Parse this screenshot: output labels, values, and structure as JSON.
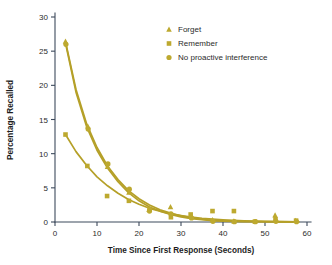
{
  "chart_data": {
    "type": "scatter",
    "title": "",
    "xlabel": "Time Since First Response (Seconds)",
    "ylabel": "Percentage Recalled",
    "xlim": [
      0,
      60
    ],
    "ylim": [
      0,
      30
    ],
    "xticks": [
      0,
      10,
      20,
      30,
      40,
      50,
      60
    ],
    "yticks": [
      0,
      5,
      10,
      15,
      20,
      25,
      30
    ],
    "xtick_labels": [
      "0",
      "10",
      "20",
      "30",
      "40",
      "50",
      "60"
    ],
    "ytick_labels": [
      "0",
      "5",
      "10",
      "15",
      "20",
      "25",
      "30"
    ],
    "grid": false,
    "legend_position": "top-right",
    "series": [
      {
        "name": "Forget",
        "marker": "triangle",
        "color": "#bda92f",
        "points": [
          {
            "x": 2.5,
            "y": 26.4
          },
          {
            "x": 7.8,
            "y": 14.0
          },
          {
            "x": 12.5,
            "y": 8.1
          },
          {
            "x": 17.6,
            "y": 4.3
          },
          {
            "x": 22.4,
            "y": 1.8
          },
          {
            "x": 27.5,
            "y": 2.2
          },
          {
            "x": 32.4,
            "y": 0.8
          },
          {
            "x": 37.5,
            "y": 0.3
          },
          {
            "x": 42.6,
            "y": 0.1
          },
          {
            "x": 52.4,
            "y": 1.0
          },
          {
            "x": 57.3,
            "y": 0.2
          }
        ]
      },
      {
        "name": "Remember",
        "marker": "square",
        "color": "#bda92f",
        "points": [
          {
            "x": 2.5,
            "y": 12.8
          },
          {
            "x": 7.7,
            "y": 8.2
          },
          {
            "x": 12.4,
            "y": 3.8
          },
          {
            "x": 17.6,
            "y": 3.1
          },
          {
            "x": 22.5,
            "y": 1.9
          },
          {
            "x": 27.6,
            "y": 0.7
          },
          {
            "x": 32.3,
            "y": 1.1
          },
          {
            "x": 37.5,
            "y": 1.6
          },
          {
            "x": 42.6,
            "y": 1.6
          },
          {
            "x": 47.6,
            "y": 0.05
          },
          {
            "x": 52.5,
            "y": 0.4
          },
          {
            "x": 57.4,
            "y": 0.2
          }
        ]
      },
      {
        "name": "No proactive interference",
        "marker": "circle",
        "color": "#bda92f",
        "points": [
          {
            "x": 2.6,
            "y": 26.0
          },
          {
            "x": 7.9,
            "y": 13.6
          },
          {
            "x": 12.6,
            "y": 8.5
          },
          {
            "x": 17.7,
            "y": 4.8
          },
          {
            "x": 22.5,
            "y": 1.6
          },
          {
            "x": 27.6,
            "y": 1.2
          },
          {
            "x": 32.5,
            "y": 0.6
          },
          {
            "x": 37.6,
            "y": 0.1
          },
          {
            "x": 42.7,
            "y": 0.05
          },
          {
            "x": 47.7,
            "y": 0.05
          },
          {
            "x": 52.6,
            "y": 0.1
          },
          {
            "x": 57.5,
            "y": 0.05
          }
        ]
      }
    ],
    "fit_curves": [
      {
        "name": "Forget fit",
        "model": "exponential-decay",
        "points": [
          {
            "x": 2.5,
            "y": 26.4
          },
          {
            "x": 5,
            "y": 19.4
          },
          {
            "x": 7.5,
            "y": 14.4
          },
          {
            "x": 10,
            "y": 10.9
          },
          {
            "x": 12.5,
            "y": 8.2
          },
          {
            "x": 15,
            "y": 6.2
          },
          {
            "x": 17.5,
            "y": 4.6
          },
          {
            "x": 20,
            "y": 3.4
          },
          {
            "x": 22.5,
            "y": 2.5
          },
          {
            "x": 25,
            "y": 1.8
          },
          {
            "x": 27.5,
            "y": 1.3
          },
          {
            "x": 30,
            "y": 0.9
          },
          {
            "x": 32.5,
            "y": 0.6
          },
          {
            "x": 35,
            "y": 0.4
          },
          {
            "x": 37.5,
            "y": 0.25
          },
          {
            "x": 40,
            "y": 0.15
          },
          {
            "x": 45,
            "y": 0.08
          },
          {
            "x": 50,
            "y": 0.05
          },
          {
            "x": 55,
            "y": 0.03
          },
          {
            "x": 58,
            "y": 0.02
          }
        ]
      },
      {
        "name": "No proactive interference fit",
        "model": "exponential-decay",
        "points": [
          {
            "x": 2.6,
            "y": 25.9
          },
          {
            "x": 5,
            "y": 19.0
          },
          {
            "x": 7.5,
            "y": 14.0
          },
          {
            "x": 10,
            "y": 10.5
          },
          {
            "x": 12.5,
            "y": 7.9
          },
          {
            "x": 15,
            "y": 5.9
          },
          {
            "x": 17.5,
            "y": 4.3
          },
          {
            "x": 20,
            "y": 3.1
          },
          {
            "x": 22.5,
            "y": 2.2
          },
          {
            "x": 25,
            "y": 1.6
          },
          {
            "x": 27.5,
            "y": 1.1
          },
          {
            "x": 30,
            "y": 0.75
          },
          {
            "x": 32.5,
            "y": 0.5
          },
          {
            "x": 35,
            "y": 0.33
          },
          {
            "x": 37.5,
            "y": 0.2
          },
          {
            "x": 40,
            "y": 0.12
          },
          {
            "x": 45,
            "y": 0.06
          },
          {
            "x": 50,
            "y": 0.04
          },
          {
            "x": 55,
            "y": 0.02
          },
          {
            "x": 58,
            "y": 0.02
          }
        ]
      },
      {
        "name": "Remember fit",
        "model": "exponential-decay",
        "points": [
          {
            "x": 2.5,
            "y": 12.8
          },
          {
            "x": 5,
            "y": 10.3
          },
          {
            "x": 7.5,
            "y": 8.3
          },
          {
            "x": 10,
            "y": 6.6
          },
          {
            "x": 12.5,
            "y": 5.3
          },
          {
            "x": 15,
            "y": 4.2
          },
          {
            "x": 17.5,
            "y": 3.3
          },
          {
            "x": 20,
            "y": 2.6
          },
          {
            "x": 22.5,
            "y": 2.0
          },
          {
            "x": 25,
            "y": 1.6
          },
          {
            "x": 27.5,
            "y": 1.2
          },
          {
            "x": 30,
            "y": 0.95
          },
          {
            "x": 32.5,
            "y": 0.72
          },
          {
            "x": 35,
            "y": 0.55
          },
          {
            "x": 37.5,
            "y": 0.42
          },
          {
            "x": 40,
            "y": 0.32
          },
          {
            "x": 45,
            "y": 0.18
          },
          {
            "x": 50,
            "y": 0.1
          },
          {
            "x": 55,
            "y": 0.06
          },
          {
            "x": 58,
            "y": 0.04
          }
        ]
      }
    ],
    "legend": [
      {
        "label": "Forget",
        "marker": "triangle"
      },
      {
        "label": "Remember",
        "marker": "square"
      },
      {
        "label": "No proactive interference",
        "marker": "circle"
      }
    ],
    "colors": {
      "series": "#bda92f",
      "curve": "#b5a028",
      "axis": "#3d4a5c",
      "text": "#2b2b2b",
      "background": "#ffffff"
    }
  }
}
